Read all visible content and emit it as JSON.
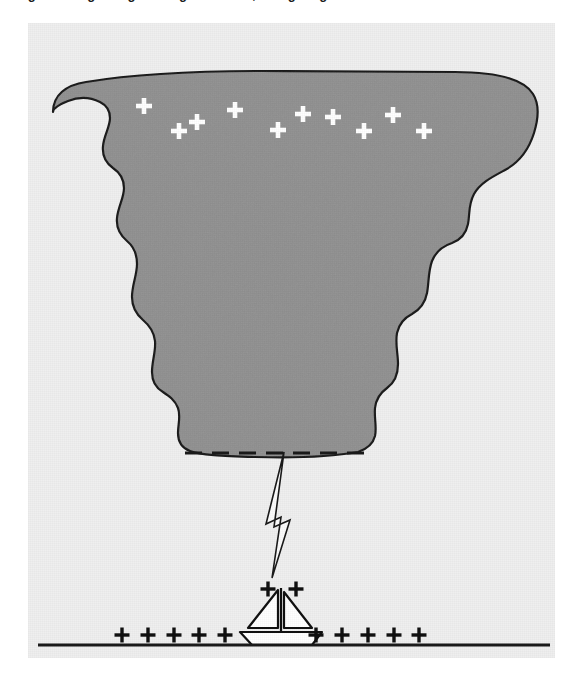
{
  "caption": {
    "text": "Figure 3: Lightning striking a sailboat; charge regions in a thunderstorm."
  },
  "figure": {
    "panel": {
      "background_color": "#efefef",
      "x": 28,
      "y": 23,
      "width": 527,
      "height": 635
    },
    "cloud": {
      "name": "cumulonimbus-anvil-cloud",
      "fill_color": "#919191",
      "outline_color": "#1a1a1a",
      "outline_width": 2.2,
      "path": "M 53 112 C 53 95, 66 85, 86 82 C 140 73, 210 71, 262 71 C 330 71, 400 72, 455 72 C 500 72, 524 80, 533 94 C 540 105, 538 120, 534 133 C 528 152, 518 163, 505 170 C 492 177, 480 183, 474 194 C 468 205, 470 214, 468 224 C 466 234, 460 240, 452 243 C 443 246, 436 251, 432 261 C 428 272, 429 283, 427 293 C 425 304, 419 310, 412 314 C 404 318, 399 324, 397 333 C 395 344, 398 353, 398 364 C 398 375, 394 383, 387 388 C 380 393, 376 399, 375 408 C 374 418, 377 427, 375 436 C 373 444, 367 449, 358 452 C 330 457, 290 458, 255 457 C 222 456, 200 455, 190 451 C 182 448, 178 442, 178 433 C 178 424, 181 416, 178 408 C 175 400, 169 396, 163 392 C 156 388, 152 381, 152 372 C 152 361, 156 351, 155 341 C 154 331, 149 325, 143 320 C 136 314, 132 307, 132 297 C 132 285, 137 275, 137 264 C 137 253, 133 246, 127 241 C 120 235, 116 228, 117 218 C 118 207, 124 198, 124 188 C 124 178, 119 172, 113 168 C 106 163, 102 156, 103 146 C 104 135, 110 127, 110 118 C 110 110, 106 105, 100 102 C 90 97, 78 97, 68 101 C 58 105, 53 109, 53 112 Z"
    },
    "cloud_charges": {
      "name": "positive-charges-in-anvil",
      "symbol": "+",
      "color": "#ffffff",
      "size": 16,
      "stroke_width": 4.6,
      "points": [
        {
          "x": 144,
          "y": 106
        },
        {
          "x": 179,
          "y": 131
        },
        {
          "x": 197,
          "y": 122
        },
        {
          "x": 235,
          "y": 110
        },
        {
          "x": 278,
          "y": 130
        },
        {
          "x": 303,
          "y": 114
        },
        {
          "x": 333,
          "y": 117
        },
        {
          "x": 364,
          "y": 131
        },
        {
          "x": 393,
          "y": 115
        },
        {
          "x": 424,
          "y": 131
        }
      ]
    },
    "cloud_base_dashes": {
      "name": "negative-charge-layer-dashed-line",
      "color": "#1a1a1a",
      "y": 453,
      "x_start": 185,
      "x_end": 370,
      "dash_length": 17,
      "gap_length": 10,
      "thickness": 3
    },
    "lightning": {
      "name": "lightning-bolt",
      "fill_color": "#fbfbfb",
      "outline_color": "#1a1a1a",
      "outline_width": 1.6,
      "path": "M 284 452 L 266 524 L 281 517 L 272 578 L 290 520 L 274 527 Z"
    },
    "boat": {
      "name": "sailboat",
      "fill_color": "#ffffff",
      "outline_color": "#111111",
      "outline_width": 2.2,
      "mast": {
        "x": 281,
        "y_top": 588,
        "y_bottom": 632
      },
      "front_sail_path": "M 278 590 L 278 628 L 248 628 Z",
      "back_sail_path": "M 284 592 L 284 628 L 312 628 Z",
      "hull_path": "M 240 632 L 322 632 L 312 645 L 252 645 Z"
    },
    "boat_charges": {
      "name": "positive-charges-at-masthead",
      "symbol": "+",
      "color": "#111111",
      "size": 15,
      "stroke_width": 3.4,
      "points": [
        {
          "x": 268,
          "y": 589
        },
        {
          "x": 296,
          "y": 589
        }
      ]
    },
    "ground": {
      "name": "ground-surface-line",
      "color": "#1a1a1a",
      "y": 645,
      "x_start": 38,
      "x_end": 550,
      "thickness": 3
    },
    "ground_charges": {
      "name": "positive-charges-on-ground",
      "symbol": "+",
      "color": "#111111",
      "size": 15,
      "stroke_width": 3.4,
      "points": [
        {
          "x": 122,
          "y": 635
        },
        {
          "x": 148,
          "y": 635
        },
        {
          "x": 174,
          "y": 635
        },
        {
          "x": 199,
          "y": 635
        },
        {
          "x": 225,
          "y": 635
        },
        {
          "x": 316,
          "y": 635
        },
        {
          "x": 342,
          "y": 635
        },
        {
          "x": 368,
          "y": 635
        },
        {
          "x": 394,
          "y": 635
        },
        {
          "x": 419,
          "y": 635
        }
      ]
    }
  }
}
